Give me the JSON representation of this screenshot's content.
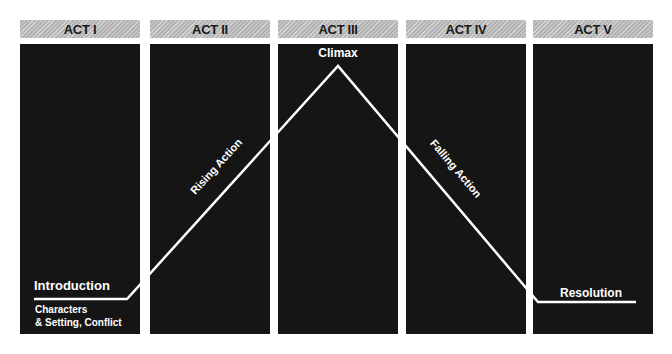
{
  "acts": [
    {
      "label": "ACT I"
    },
    {
      "label": "ACT II"
    },
    {
      "label": "ACT III"
    },
    {
      "label": "ACT IV"
    },
    {
      "label": "ACT V"
    }
  ],
  "stages": {
    "introduction": "Introduction",
    "introduction_detail_1": "Characters",
    "introduction_detail_2": "& Setting, Conflict",
    "rising_action": "Rising Action",
    "climax": "Climax",
    "falling_action": "Falling Action",
    "resolution": "Resolution"
  },
  "colors": {
    "header_bg": "#bdbdbd",
    "panel_bg": "#151515",
    "line": "#ffffff",
    "header_text": "#1a1a1a",
    "label_text": "#ffffff"
  },
  "plot_line_points": [
    [
      34,
      299
    ],
    [
      127,
      299
    ],
    [
      338,
      66
    ],
    [
      538,
      302
    ],
    [
      636,
      302
    ]
  ]
}
